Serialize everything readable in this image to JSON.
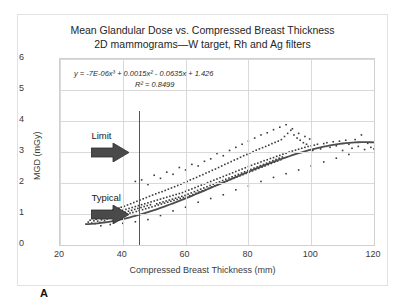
{
  "figure": {
    "panel_label": "A"
  },
  "chart_data": {
    "type": "scatter",
    "title": "Mean Glandular Dose vs. Compressed Breast Thickness",
    "subtitle": "2D mammograms—W target, Rh and Ag filters",
    "xlabel": "Compressed Breast Thickness (mm)",
    "ylabel": "MGD (mGy)",
    "xlim": [
      20,
      120
    ],
    "ylim": [
      0,
      6
    ],
    "xticks": [
      20,
      40,
      60,
      80,
      100,
      120
    ],
    "yticks": [
      0,
      1,
      2,
      3,
      4,
      5,
      6
    ],
    "grid": true,
    "legend": "none",
    "marker": {
      "shape": "square",
      "color": "#3a3a3a",
      "size": 1.6
    },
    "equation": "y = -7E-06x³ + 0.0015x² - 0.0635x + 1.426",
    "r_squared_label": "R² = 0.8499",
    "fit": {
      "type": "cubic",
      "coefficients": {
        "x3": -7e-06,
        "x2": 0.0015,
        "x1": -0.0635,
        "x0": 1.426
      },
      "r_squared": 0.8499,
      "color": "#4d4d4d",
      "x_start": 28,
      "x_end": 120
    },
    "reference_line": {
      "orientation": "vertical",
      "x": 45,
      "y_start": 0,
      "y_end": 4.32,
      "color": "#555555"
    },
    "annotations": [
      {
        "label": "Limit",
        "arrow": "right",
        "x": 30,
        "y": 3.35
      },
      {
        "label": "Typical",
        "arrow": "right",
        "x": 30,
        "y": 1.35
      }
    ],
    "points": [
      [
        29.0,
        0.74
      ],
      [
        29.6,
        0.8
      ],
      [
        30.1,
        0.71
      ],
      [
        30.4,
        0.86
      ],
      [
        30.8,
        0.78
      ],
      [
        31.0,
        0.92
      ],
      [
        31.2,
        0.69
      ],
      [
        31.5,
        0.83
      ],
      [
        31.8,
        0.95
      ],
      [
        32.0,
        0.77
      ],
      [
        32.2,
        0.88
      ],
      [
        32.5,
        1.02
      ],
      [
        32.7,
        0.73
      ],
      [
        33.0,
        0.9
      ],
      [
        33.2,
        0.81
      ],
      [
        33.4,
        0.97
      ],
      [
        33.7,
        0.86
      ],
      [
        34.0,
        1.05
      ],
      [
        34.2,
        0.79
      ],
      [
        34.5,
        0.93
      ],
      [
        34.7,
        1.1
      ],
      [
        35.0,
        0.84
      ],
      [
        35.2,
        0.99
      ],
      [
        35.4,
        0.9
      ],
      [
        35.7,
        1.08
      ],
      [
        36.0,
        0.87
      ],
      [
        36.2,
        1.01
      ],
      [
        36.5,
        0.94
      ],
      [
        36.8,
        1.13
      ],
      [
        37.0,
        0.89
      ],
      [
        37.2,
        1.04
      ],
      [
        37.5,
        0.96
      ],
      [
        37.8,
        1.16
      ],
      [
        38.0,
        0.91
      ],
      [
        38.3,
        1.07
      ],
      [
        38.5,
        0.98
      ],
      [
        38.8,
        1.19
      ],
      [
        39.0,
        1.09
      ],
      [
        39.3,
        0.94
      ],
      [
        39.5,
        1.22
      ],
      [
        39.8,
        1.03
      ],
      [
        40.0,
        1.12
      ],
      [
        40.2,
        0.97
      ],
      [
        40.5,
        1.25
      ],
      [
        40.7,
        1.06
      ],
      [
        41.0,
        1.15
      ],
      [
        41.2,
        1.0
      ],
      [
        41.5,
        1.29
      ],
      [
        41.8,
        1.09
      ],
      [
        42.0,
        1.18
      ],
      [
        42.3,
        1.03
      ],
      [
        42.5,
        1.33
      ],
      [
        42.8,
        1.12
      ],
      [
        43.0,
        1.21
      ],
      [
        43.2,
        1.05
      ],
      [
        43.5,
        1.37
      ],
      [
        43.8,
        1.15
      ],
      [
        44.0,
        1.24
      ],
      [
        44.3,
        1.08
      ],
      [
        44.5,
        1.41
      ],
      [
        44.8,
        1.18
      ],
      [
        45.0,
        1.27
      ],
      [
        45.2,
        1.11
      ],
      [
        45.5,
        1.45
      ],
      [
        45.8,
        1.21
      ],
      [
        46.0,
        1.3
      ],
      [
        46.3,
        1.14
      ],
      [
        46.5,
        1.49
      ],
      [
        46.8,
        1.24
      ],
      [
        47.0,
        1.33
      ],
      [
        47.3,
        1.17
      ],
      [
        47.5,
        1.53
      ],
      [
        47.8,
        1.27
      ],
      [
        48.0,
        1.36
      ],
      [
        48.3,
        1.2
      ],
      [
        48.5,
        1.57
      ],
      [
        48.8,
        1.3
      ],
      [
        49.0,
        1.39
      ],
      [
        49.3,
        1.23
      ],
      [
        49.5,
        1.61
      ],
      [
        50.0,
        1.42
      ],
      [
        50.3,
        1.26
      ],
      [
        50.5,
        1.65
      ],
      [
        50.8,
        1.33
      ],
      [
        51.0,
        1.45
      ],
      [
        51.3,
        1.29
      ],
      [
        51.5,
        1.69
      ],
      [
        51.8,
        1.36
      ],
      [
        52.0,
        1.48
      ],
      [
        52.3,
        1.32
      ],
      [
        52.5,
        1.72
      ],
      [
        52.8,
        1.39
      ],
      [
        53.0,
        1.51
      ],
      [
        53.3,
        1.35
      ],
      [
        53.5,
        1.76
      ],
      [
        53.8,
        1.42
      ],
      [
        54.0,
        1.54
      ],
      [
        54.3,
        1.38
      ],
      [
        54.5,
        1.8
      ],
      [
        54.8,
        1.45
      ],
      [
        55.0,
        1.57
      ],
      [
        55.3,
        1.41
      ],
      [
        55.5,
        1.84
      ],
      [
        55.8,
        1.48
      ],
      [
        56.0,
        1.6
      ],
      [
        56.3,
        1.44
      ],
      [
        56.5,
        1.88
      ],
      [
        56.8,
        1.51
      ],
      [
        57.0,
        1.63
      ],
      [
        57.3,
        1.47
      ],
      [
        57.5,
        1.92
      ],
      [
        57.8,
        1.54
      ],
      [
        58.0,
        1.66
      ],
      [
        58.3,
        1.5
      ],
      [
        58.5,
        1.96
      ],
      [
        58.8,
        1.57
      ],
      [
        59.0,
        1.69
      ],
      [
        59.3,
        1.53
      ],
      [
        59.5,
        2.0
      ],
      [
        59.8,
        1.6
      ],
      [
        60.0,
        1.73
      ],
      [
        60.3,
        1.56
      ],
      [
        60.5,
        2.05
      ],
      [
        60.8,
        1.64
      ],
      [
        61.0,
        1.77
      ],
      [
        61.3,
        1.59
      ],
      [
        61.5,
        2.1
      ],
      [
        61.8,
        1.68
      ],
      [
        62.0,
        1.81
      ],
      [
        62.3,
        1.63
      ],
      [
        62.5,
        2.14
      ],
      [
        62.8,
        1.72
      ],
      [
        63.0,
        1.85
      ],
      [
        63.3,
        1.67
      ],
      [
        63.5,
        2.18
      ],
      [
        63.8,
        1.76
      ],
      [
        64.0,
        1.89
      ],
      [
        64.3,
        1.71
      ],
      [
        64.5,
        2.23
      ],
      [
        64.8,
        1.8
      ],
      [
        65.0,
        1.93
      ],
      [
        65.3,
        1.75
      ],
      [
        65.5,
        2.27
      ],
      [
        65.8,
        1.84
      ],
      [
        66.0,
        1.97
      ],
      [
        66.3,
        1.79
      ],
      [
        66.5,
        2.32
      ],
      [
        66.8,
        1.88
      ],
      [
        67.0,
        2.01
      ],
      [
        67.3,
        1.83
      ],
      [
        67.5,
        2.36
      ],
      [
        67.8,
        1.92
      ],
      [
        68.0,
        2.05
      ],
      [
        68.3,
        1.87
      ],
      [
        68.5,
        2.41
      ],
      [
        68.8,
        1.96
      ],
      [
        69.0,
        2.09
      ],
      [
        69.3,
        1.91
      ],
      [
        69.5,
        2.45
      ],
      [
        69.8,
        2.0
      ],
      [
        70.0,
        2.13
      ],
      [
        70.3,
        1.95
      ],
      [
        70.5,
        2.5
      ],
      [
        70.8,
        2.04
      ],
      [
        71.0,
        2.17
      ],
      [
        71.3,
        1.99
      ],
      [
        71.5,
        2.55
      ],
      [
        71.8,
        2.08
      ],
      [
        72.0,
        2.21
      ],
      [
        72.3,
        2.03
      ],
      [
        72.5,
        2.6
      ],
      [
        72.8,
        2.12
      ],
      [
        73.0,
        2.25
      ],
      [
        73.3,
        2.07
      ],
      [
        73.5,
        2.64
      ],
      [
        73.8,
        2.16
      ],
      [
        74.0,
        2.29
      ],
      [
        74.3,
        2.11
      ],
      [
        74.5,
        2.69
      ],
      [
        74.8,
        2.2
      ],
      [
        75.0,
        2.33
      ],
      [
        75.3,
        2.15
      ],
      [
        75.5,
        2.74
      ],
      [
        75.8,
        2.24
      ],
      [
        76.0,
        2.37
      ],
      [
        76.3,
        2.19
      ],
      [
        76.5,
        2.78
      ],
      [
        76.8,
        2.28
      ],
      [
        77.0,
        2.41
      ],
      [
        77.3,
        2.23
      ],
      [
        77.5,
        2.83
      ],
      [
        77.8,
        2.32
      ],
      [
        78.0,
        2.45
      ],
      [
        78.3,
        2.27
      ],
      [
        78.5,
        2.88
      ],
      [
        78.8,
        2.36
      ],
      [
        79.0,
        2.49
      ],
      [
        79.3,
        2.31
      ],
      [
        79.5,
        2.92
      ],
      [
        79.8,
        2.4
      ],
      [
        80.0,
        2.53
      ],
      [
        80.3,
        2.35
      ],
      [
        80.5,
        2.97
      ],
      [
        80.8,
        2.44
      ],
      [
        81.0,
        2.57
      ],
      [
        81.3,
        2.39
      ],
      [
        81.5,
        3.01
      ],
      [
        81.8,
        2.48
      ],
      [
        82.0,
        2.61
      ],
      [
        82.3,
        2.43
      ],
      [
        82.5,
        3.06
      ],
      [
        82.8,
        2.52
      ],
      [
        83.0,
        2.64
      ],
      [
        83.3,
        2.47
      ],
      [
        83.5,
        3.1
      ],
      [
        83.8,
        2.56
      ],
      [
        84.0,
        2.68
      ],
      [
        84.3,
        2.51
      ],
      [
        84.5,
        3.14
      ],
      [
        84.8,
        2.6
      ],
      [
        85.0,
        2.72
      ],
      [
        85.3,
        2.55
      ],
      [
        85.5,
        3.18
      ],
      [
        85.8,
        2.64
      ],
      [
        86.0,
        2.75
      ],
      [
        86.3,
        2.59
      ],
      [
        86.5,
        3.22
      ],
      [
        86.8,
        2.68
      ],
      [
        87.0,
        2.79
      ],
      [
        87.3,
        2.63
      ],
      [
        87.5,
        3.27
      ],
      [
        87.8,
        2.72
      ],
      [
        88.0,
        2.82
      ],
      [
        88.3,
        2.67
      ],
      [
        88.5,
        3.31
      ],
      [
        88.8,
        2.76
      ],
      [
        89.0,
        2.86
      ],
      [
        89.3,
        2.71
      ],
      [
        89.5,
        3.35
      ],
      [
        89.8,
        2.8
      ],
      [
        90.0,
        2.89
      ],
      [
        90.3,
        2.75
      ],
      [
        90.5,
        3.4
      ],
      [
        90.8,
        2.84
      ],
      [
        91.0,
        2.93
      ],
      [
        91.5,
        3.5
      ],
      [
        92.0,
        2.96
      ],
      [
        92.5,
        3.6
      ],
      [
        93.0,
        3.0
      ],
      [
        93.5,
        3.7
      ],
      [
        94.0,
        3.03
      ],
      [
        94.5,
        3.55
      ],
      [
        95.0,
        3.06
      ],
      [
        95.5,
        3.45
      ],
      [
        96.0,
        3.09
      ],
      [
        96.5,
        3.38
      ],
      [
        97.0,
        3.12
      ],
      [
        97.5,
        3.3
      ],
      [
        98.0,
        3.15
      ],
      [
        98.5,
        3.25
      ],
      [
        99.0,
        3.18
      ],
      [
        99.5,
        3.42
      ],
      [
        100.0,
        3.2
      ],
      [
        100.5,
        3.05
      ],
      [
        101.0,
        3.22
      ],
      [
        102.0,
        3.25
      ],
      [
        103.0,
        3.1
      ],
      [
        104.0,
        3.27
      ],
      [
        105.0,
        3.3
      ],
      [
        106.0,
        3.15
      ],
      [
        107.0,
        3.33
      ],
      [
        108.0,
        3.2
      ],
      [
        109.0,
        3.35
      ],
      [
        110.0,
        3.05
      ],
      [
        111.0,
        3.38
      ],
      [
        112.0,
        3.25
      ],
      [
        113.0,
        3.12
      ],
      [
        114.0,
        3.4
      ],
      [
        115.0,
        3.18
      ],
      [
        116.0,
        3.55
      ],
      [
        117.0,
        3.08
      ],
      [
        118.0,
        3.28
      ],
      [
        119.0,
        3.15
      ],
      [
        120.0,
        3.1
      ],
      [
        44.0,
        2.05
      ],
      [
        46.0,
        2.1
      ],
      [
        48.0,
        1.95
      ],
      [
        50.0,
        2.25
      ],
      [
        52.0,
        2.15
      ],
      [
        54.0,
        2.35
      ],
      [
        56.0,
        2.28
      ],
      [
        58.0,
        2.5
      ],
      [
        60.0,
        2.42
      ],
      [
        62.0,
        2.6
      ],
      [
        64.0,
        2.55
      ],
      [
        66.0,
        2.7
      ],
      [
        68.0,
        2.78
      ],
      [
        70.0,
        2.95
      ],
      [
        72.0,
        2.88
      ],
      [
        74.0,
        3.05
      ],
      [
        76.0,
        3.15
      ],
      [
        78.0,
        3.25
      ],
      [
        80.0,
        3.35
      ],
      [
        82.0,
        3.45
      ],
      [
        84.0,
        3.55
      ],
      [
        86.0,
        3.62
      ],
      [
        88.0,
        3.72
      ],
      [
        90.0,
        3.8
      ],
      [
        92.0,
        3.88
      ],
      [
        94.0,
        3.75
      ],
      [
        96.0,
        3.6
      ],
      [
        98.0,
        3.5
      ],
      [
        33.0,
        0.62
      ],
      [
        36.0,
        0.66
      ],
      [
        40.0,
        0.7
      ],
      [
        44.0,
        0.75
      ],
      [
        48.0,
        0.82
      ],
      [
        52.0,
        0.95
      ],
      [
        56.0,
        1.1
      ],
      [
        60.0,
        1.22
      ],
      [
        64.0,
        1.38
      ],
      [
        68.0,
        1.5
      ],
      [
        72.0,
        1.62
      ],
      [
        76.0,
        1.78
      ],
      [
        80.0,
        1.9
      ],
      [
        84.0,
        2.05
      ],
      [
        88.0,
        2.18
      ],
      [
        92.0,
        2.3
      ],
      [
        96.0,
        2.42
      ],
      [
        100.0,
        2.55
      ],
      [
        104.0,
        2.68
      ],
      [
        108.0,
        2.8
      ],
      [
        112.0,
        2.92
      ]
    ]
  }
}
